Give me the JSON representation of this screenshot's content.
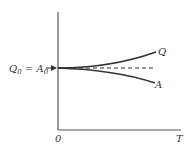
{
  "diagram": {
    "type": "line-graph-schematic",
    "y_intercept_label": {
      "left": "Q",
      "left_sub": "0",
      "eq": " = ",
      "right": "A",
      "right_sub": "0"
    },
    "origin_label": "0",
    "x_axis_label": "T",
    "curves": [
      {
        "name": "Q",
        "label": "Q",
        "direction": "rising",
        "style": "solid"
      },
      {
        "name": "A",
        "label": "A",
        "direction": "falling",
        "style": "solid"
      },
      {
        "name": "baseline",
        "label": "",
        "direction": "flat",
        "style": "dashed"
      }
    ],
    "colors": {
      "line": "#333333",
      "background": "#ffffff"
    }
  }
}
